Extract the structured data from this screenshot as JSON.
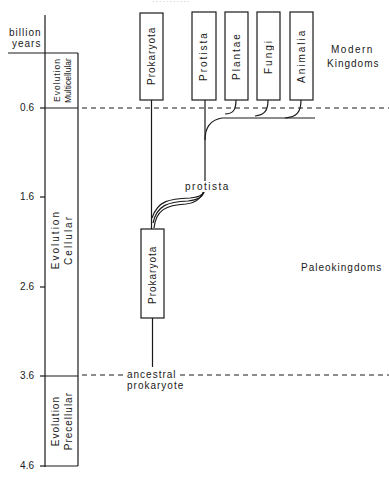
{
  "top_fragment": "...........",
  "axis": {
    "title_line1": "billion",
    "title_line2": "years",
    "ticks": [
      "0.6",
      "1.6",
      "2.6",
      "3.6",
      "4.6"
    ]
  },
  "eras": {
    "multicellular_line1": "Multicellular",
    "multicellular_line2": "Evolution",
    "cellular_line1": "Cellular",
    "cellular_line2": "Evolution",
    "precellular_line1": "Precellular",
    "precellular_line2": "Evolution"
  },
  "modern_kingdoms": {
    "label_line1": "Modern",
    "label_line2": "Kingdoms",
    "boxes": [
      "Prokaryota",
      "Protista",
      "Plantae",
      "Fungi",
      "Animalia"
    ]
  },
  "paleo": {
    "label": "Paleokingdoms",
    "box": "Prokaryota",
    "protista_label": "protista",
    "ancestor_line1": "ancestral",
    "ancestor_line2": "prokaryote"
  },
  "colors": {
    "ink": "#1a1a1a",
    "background": "#ffffff",
    "faint": "#c8c8c8"
  }
}
